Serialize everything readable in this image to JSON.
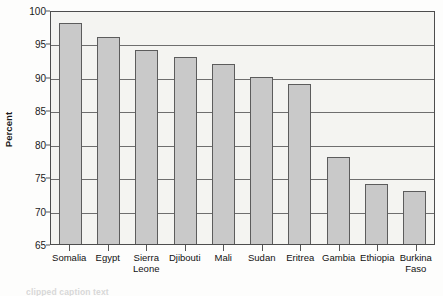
{
  "chart_data": {
    "type": "bar",
    "title": "",
    "xlabel": "",
    "ylabel": "Percent",
    "ylim": [
      65,
      100
    ],
    "ytick_step": 5,
    "yticks": [
      65,
      70,
      75,
      80,
      85,
      90,
      95,
      100
    ],
    "grid": true,
    "legend": "none",
    "categories": [
      "Somalia",
      "Sierra Leone",
      "Egypt",
      "Djibouti",
      "Mali",
      "Sudan",
      "Eritrea",
      "Gambia",
      "Ethiopia",
      "Burkina Faso"
    ],
    "bars": [
      {
        "label_line1": "Somalia",
        "label_line2": "",
        "value": 98
      },
      {
        "label_line1": "Egypt",
        "label_line2": "",
        "value": 96
      },
      {
        "label_line1": "Sierra",
        "label_line2": "Leone",
        "value": 94
      },
      {
        "label_line1": "Djibouti",
        "label_line2": "",
        "value": 93
      },
      {
        "label_line1": "Mali",
        "label_line2": "",
        "value": 92
      },
      {
        "label_line1": "Sudan",
        "label_line2": "",
        "value": 90
      },
      {
        "label_line1": "Eritrea",
        "label_line2": "",
        "value": 89
      },
      {
        "label_line1": "Gambia",
        "label_line2": "",
        "value": 78
      },
      {
        "label_line1": "Ethiopia",
        "label_line2": "",
        "value": 74
      },
      {
        "label_line1": "Burkina",
        "label_line2": "Faso",
        "value": 73
      }
    ],
    "values": [
      98,
      96,
      94,
      93,
      92,
      90,
      89,
      78,
      74,
      73
    ],
    "colors": {
      "bar_fill": "#c9c9c9",
      "bar_border": "#5c5c5c",
      "plot_background": "#f4f4f1",
      "gridline": "#6e6e6e",
      "axis": "#4d4d4d",
      "text": "#1a1a1a"
    }
  },
  "caption": {
    "text": "clipped caption text"
  }
}
